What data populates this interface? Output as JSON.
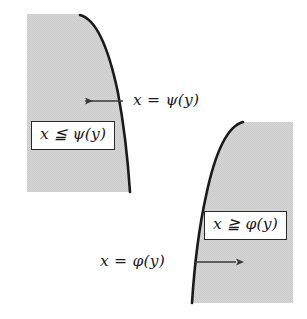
{
  "figure": {
    "background_color": "#ffffff",
    "shade_color": "#d4d4d4",
    "curve_color": "#1a1a1a",
    "arrow_color": "#3a3a3a",
    "box_border_color": "#2a2a2a",
    "regions": [
      {
        "id": "upper-left-region",
        "name": "psi-region",
        "fill": "#d4d4d4",
        "bounds": {
          "left": 27,
          "top": 14,
          "right": 131,
          "bottom": 192
        },
        "curve_label": "x = ψ(y)",
        "inequality_label": "x ≦ ψ(y)",
        "arrow_direction": "left"
      },
      {
        "id": "lower-right-region",
        "name": "phi-region",
        "fill": "#d4d4d4",
        "bounds": {
          "left": 191,
          "top": 121,
          "right": 293,
          "bottom": 303
        },
        "curve_label": "x = φ(y)",
        "inequality_label": "x ≧ φ(y)",
        "arrow_direction": "right"
      }
    ],
    "labels": {
      "psi_curve": "x = ψ(y)",
      "psi_inequality": "x ≦ ψ(y)",
      "phi_curve": "x = φ(y)",
      "phi_inequality": "x ≧ φ(y)"
    }
  }
}
